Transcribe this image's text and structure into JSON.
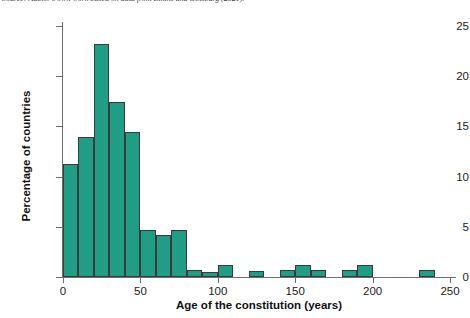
{
  "caption": {
    "source_text": "Source: Author's own work based on data from Elkins and Ginsburg (2021)."
  },
  "chart_data": {
    "type": "bar",
    "title": "",
    "subtitle": "",
    "xlabel": "Age of the constitution (years)",
    "ylabel": "Percentage of countries",
    "xlim": [
      0,
      250
    ],
    "ylim": [
      0,
      26
    ],
    "xticks": [
      0,
      50,
      100,
      150,
      200,
      250
    ],
    "yticks": [
      0,
      5,
      10,
      15,
      20,
      25
    ],
    "xtick_labels": [
      "0",
      "50",
      "100",
      "150",
      "200",
      "250"
    ],
    "ytick_labels": [
      "0",
      "5",
      "10",
      "15",
      "20",
      "25"
    ],
    "grid": false,
    "legend": false,
    "legend_position": "none",
    "bar_color": "#1f9e85",
    "bar_edge_color": "#3a3a3a",
    "bin_width": 10,
    "bin_starts": [
      0,
      10,
      20,
      30,
      40,
      50,
      60,
      70,
      80,
      90,
      100,
      110,
      120,
      130,
      140,
      150,
      160,
      170,
      180,
      190,
      200,
      210,
      220,
      230
    ],
    "categories": [
      "0-10",
      "10-20",
      "20-30",
      "30-40",
      "40-50",
      "50-60",
      "60-70",
      "70-80",
      "80-90",
      "90-100",
      "100-110",
      "110-120",
      "120-130",
      "130-140",
      "140-150",
      "150-160",
      "160-170",
      "170-180",
      "180-190",
      "190-200",
      "200-210",
      "210-220",
      "220-230",
      "230-240"
    ],
    "values": [
      11.3,
      13.9,
      23.2,
      17.4,
      14.4,
      4.7,
      4.2,
      4.7,
      0.7,
      0.5,
      1.2,
      0,
      0.6,
      0,
      0.7,
      1.2,
      0.7,
      0,
      0.7,
      1.2,
      0,
      0,
      0,
      0.7
    ]
  }
}
